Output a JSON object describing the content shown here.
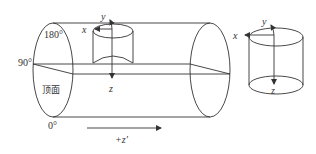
{
  "diagram": {
    "pipe": {
      "angle_labels": {
        "top": "180°",
        "side": "90°",
        "bottom": "0°"
      },
      "face_label": "顶面",
      "direction_label": "+z′"
    },
    "inner_cylinder": {
      "axes": {
        "x": "x",
        "y": "y",
        "z": "z"
      }
    },
    "standalone_cylinder": {
      "axes": {
        "x": "x",
        "y": "y",
        "z": "z"
      }
    },
    "colors": {
      "line": "#333333",
      "background": "#ffffff"
    }
  }
}
